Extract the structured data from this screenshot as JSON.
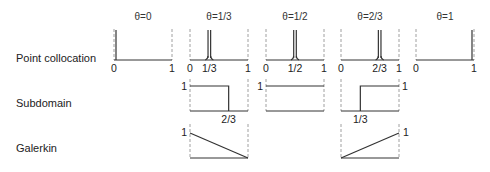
{
  "rows": [
    {
      "label": "Point collocation"
    },
    {
      "label": "Subdomain"
    },
    {
      "label": "Galerkin"
    }
  ],
  "columns": [
    {
      "theta_label": "θ=0",
      "theta": 0,
      "point_tick": "0",
      "end_tick_0": "0",
      "end_tick_1": "1"
    },
    {
      "theta_label": "θ=1/3",
      "theta": 0.3333,
      "point_tick": "1/3",
      "end_tick_0": "0",
      "end_tick_1": "1"
    },
    {
      "theta_label": "θ=1/2",
      "theta": 0.5,
      "point_tick": "1/2",
      "end_tick_0": "0",
      "end_tick_1": "1"
    },
    {
      "theta_label": "θ=2/3",
      "theta": 0.6667,
      "point_tick": "2/3",
      "end_tick_0": "0",
      "end_tick_1": "1"
    },
    {
      "theta_label": "θ=1",
      "theta": 1,
      "point_tick": "1",
      "end_tick_0": "0",
      "end_tick_1": "1"
    }
  ],
  "subdomain": [
    {
      "column": 1,
      "x_from": 0,
      "x_to": 0.6667,
      "height_label": "1",
      "height_label_side": "left",
      "x_label": "2/3"
    },
    {
      "column": 2,
      "x_from": 0,
      "x_to": 1,
      "height_label": "1",
      "height_label_side": "left",
      "x_label": ""
    },
    {
      "column": 3,
      "x_from": 0.3333,
      "x_to": 1,
      "height_label": "1",
      "height_label_side": "right",
      "x_label": "1/3"
    }
  ],
  "galerkin": [
    {
      "column": 1,
      "y_start": 1,
      "y_end": 0,
      "height_label": "1",
      "height_label_side": "left"
    },
    {
      "column": 3,
      "y_start": 0,
      "y_end": 1,
      "height_label": "1",
      "height_label_side": "right"
    }
  ]
}
